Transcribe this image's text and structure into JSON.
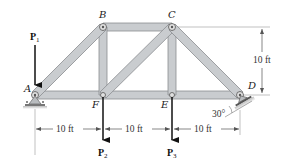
{
  "diagram": {
    "joints": {
      "A": "A",
      "B": "B",
      "C": "C",
      "D": "D",
      "E": "E",
      "F": "F"
    },
    "members": [
      "AB",
      "BC",
      "CD",
      "AF",
      "FE",
      "ED",
      "BF",
      "CE",
      "FC"
    ],
    "forces": {
      "P1": {
        "label": "P",
        "sub": "1"
      },
      "P2": {
        "label": "P",
        "sub": "2"
      },
      "P3": {
        "label": "P",
        "sub": "3"
      }
    },
    "dimensions": {
      "span1": "10 ft",
      "span2": "10 ft",
      "span3": "10 ft",
      "height": "10 ft"
    },
    "support_angle": "30°",
    "colors": {
      "member_fill": "#c9cccf",
      "member_edge": "#8a8d90",
      "arrow": "#111111",
      "dim_line": "#555555"
    }
  }
}
